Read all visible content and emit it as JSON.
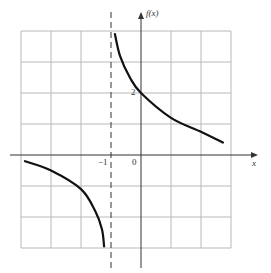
{
  "chart_data": {
    "type": "line",
    "title": "",
    "xlabel": "x",
    "ylabel": "f(x)",
    "xlim": [
      -4,
      3
    ],
    "ylim": [
      -3,
      4
    ],
    "grid": true,
    "asymptote": {
      "type": "vertical",
      "x": -1,
      "style": "dashed"
    },
    "tick_labels": [
      {
        "text": "-1",
        "axis": "x",
        "value": -1
      },
      {
        "text": "0",
        "axis": "x",
        "value": 0
      },
      {
        "text": "2",
        "axis": "y",
        "value": 2
      }
    ],
    "series": [
      {
        "name": "upper branch",
        "x": [
          -0.87,
          -0.7,
          -0.37,
          0,
          1,
          2,
          2.73
        ],
        "y": [
          3.9,
          3.2,
          2.5,
          2.0,
          1.2,
          0.75,
          0.4
        ]
      },
      {
        "name": "lower branch",
        "x": [
          -3.87,
          -3,
          -2,
          -1.53,
          -1.3,
          -1.23
        ],
        "y": [
          -0.2,
          -0.5,
          -1.1,
          -1.8,
          -2.4,
          -2.95
        ]
      }
    ]
  },
  "labels": {
    "y_axis": "f(x)",
    "x_axis": "x",
    "neg_one": "−1",
    "zero": "0",
    "two": "2"
  },
  "colors": {
    "grid": "#b8b8b8",
    "axis": "#333333",
    "curve": "#111111"
  }
}
